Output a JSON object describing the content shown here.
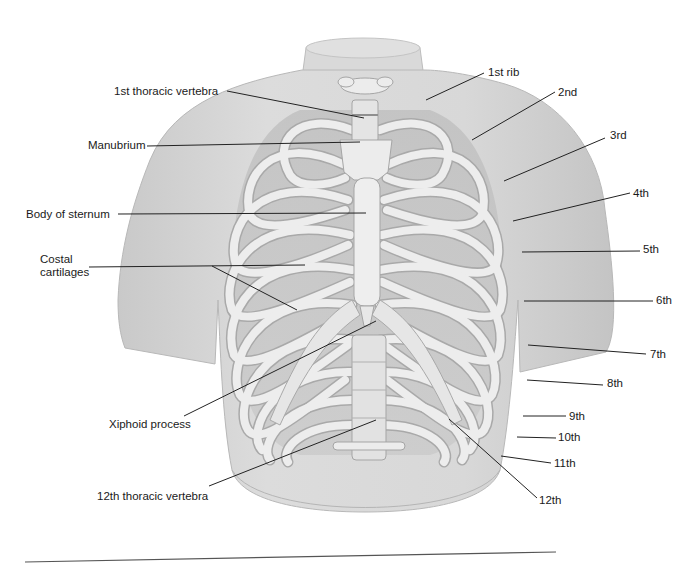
{
  "figure": {
    "colors": {
      "background": "#ffffff",
      "body_skin": "#d6d6d6",
      "body_shadow": "#bdbdbd",
      "bone": "#ececec",
      "bone_outline": "#a8a8a8",
      "leader_line": "#222222",
      "text": "#1a1a1a"
    }
  },
  "labels_left": [
    {
      "id": "first-thoracic-vertebra",
      "text": "1st thoracic vertebra",
      "x": 114,
      "y": 85
    },
    {
      "id": "manubrium",
      "text": "Manubrium",
      "x": 88,
      "y": 139
    },
    {
      "id": "body-of-sternum",
      "text": "Body of sternum",
      "x": 26,
      "y": 208
    },
    {
      "id": "costal-cartilages",
      "text": "Costal\ncartilages",
      "x": 40,
      "y": 255
    },
    {
      "id": "xiphoid-process",
      "text": "Xiphoid process",
      "x": 109,
      "y": 418
    },
    {
      "id": "twelfth-thoracic-vertebra",
      "text": "12th thoracic vertebra",
      "x": 97,
      "y": 490
    }
  ],
  "labels_right": [
    {
      "id": "rib-1",
      "text": "1st rib",
      "x": 488,
      "y": 66
    },
    {
      "id": "rib-2",
      "text": "2nd",
      "x": 558,
      "y": 86
    },
    {
      "id": "rib-3",
      "text": "3rd",
      "x": 610,
      "y": 129
    },
    {
      "id": "rib-4",
      "text": "4th",
      "x": 633,
      "y": 187
    },
    {
      "id": "rib-5",
      "text": "5th",
      "x": 643,
      "y": 243
    },
    {
      "id": "rib-6",
      "text": "6th",
      "x": 656,
      "y": 294
    },
    {
      "id": "rib-7",
      "text": "7th",
      "x": 650,
      "y": 348
    },
    {
      "id": "rib-8",
      "text": "8th",
      "x": 607,
      "y": 377
    },
    {
      "id": "rib-9",
      "text": "9th",
      "x": 569,
      "y": 410
    },
    {
      "id": "rib-10",
      "text": "10th",
      "x": 558,
      "y": 431
    },
    {
      "id": "rib-11",
      "text": "11th",
      "x": 554,
      "y": 457
    },
    {
      "id": "rib-12",
      "text": "12th",
      "x": 539,
      "y": 494
    }
  ]
}
